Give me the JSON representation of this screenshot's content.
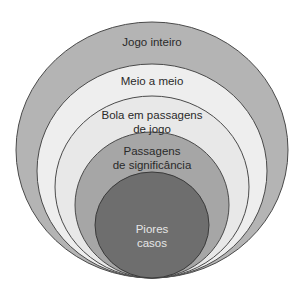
{
  "diagram": {
    "type": "nested-circles",
    "levels": [
      {
        "label_line1": "Jogo inteiro",
        "label_line2": "",
        "fill": "#b4b4b4"
      },
      {
        "label_line1": "Meio a meio",
        "label_line2": "",
        "fill": "#eeeeee"
      },
      {
        "label_line1": "Bola em passagens",
        "label_line2": "de jogo",
        "fill": "#eaeaea"
      },
      {
        "label_line1": "Passagens",
        "label_line2": "de significância",
        "fill": "#a6a6a6"
      },
      {
        "label_line1": "Piores",
        "label_line2": "casos",
        "fill": "#6e6e6e"
      }
    ],
    "stroke": "#4a4a4a"
  }
}
